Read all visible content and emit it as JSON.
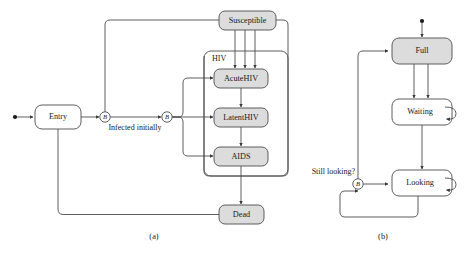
{
  "figure": {
    "panels": [
      {
        "id": "a",
        "caption": "(a)",
        "group_label": "HIV",
        "nodes": [
          {
            "id": "entry",
            "label": "Entry",
            "filled": false
          },
          {
            "id": "susceptible",
            "label": "Susceptible",
            "filled": true
          },
          {
            "id": "acutehiv",
            "label": "AcuteHIV",
            "filled": true
          },
          {
            "id": "latenthiv",
            "label": "LatentHIV",
            "filled": true
          },
          {
            "id": "aids",
            "label": "AIDS",
            "filled": true
          },
          {
            "id": "dead",
            "label": "Dead",
            "filled": true
          }
        ],
        "branch_nodes": [
          {
            "id": "branch-a1",
            "label": "B"
          },
          {
            "id": "branch-a2",
            "label": "B"
          }
        ],
        "edge_labels": [
          {
            "id": "infected-initially",
            "label": "Infected initially"
          }
        ]
      },
      {
        "id": "b",
        "caption": "(b)",
        "nodes": [
          {
            "id": "full",
            "label": "Full",
            "filled": true
          },
          {
            "id": "waiting",
            "label": "Waiting",
            "filled": false
          },
          {
            "id": "looking",
            "label": "Looking",
            "filled": false
          }
        ],
        "branch_nodes": [
          {
            "id": "branch-b1",
            "label": "B"
          }
        ],
        "edge_labels": [
          {
            "id": "still-looking",
            "label": "Still looking?"
          }
        ]
      }
    ]
  },
  "colors": {
    "node_fill": "#dcdcdc",
    "node_stroke": "#4d4d4d",
    "plain_fill": "#ffffff",
    "text": "#1a1a1a",
    "background": "#ffffff"
  }
}
